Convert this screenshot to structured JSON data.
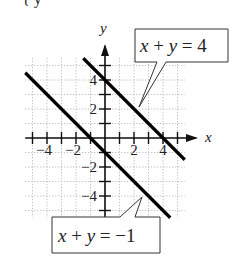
{
  "figure": {
    "top_fragment": "{   y",
    "axes": {
      "x_label": "x",
      "y_label": "y",
      "x_ticks": [
        -5,
        -4,
        -3,
        -2,
        -1,
        1,
        2,
        3,
        4,
        5
      ],
      "y_ticks": [
        -5,
        -4,
        -3,
        -2,
        -1,
        1,
        2,
        3,
        4,
        5
      ],
      "x_tick_labels": [
        {
          "value": -4,
          "text": "−4"
        },
        {
          "value": -2,
          "text": "−2"
        },
        {
          "value": 2,
          "text": "2"
        },
        {
          "value": 4,
          "text": "4"
        }
      ],
      "y_tick_labels": [
        {
          "value": 4,
          "text": "4"
        },
        {
          "value": 2,
          "text": "2"
        },
        {
          "value": -2,
          "text": "−2"
        },
        {
          "value": -4,
          "text": "−4"
        }
      ],
      "range": [
        -5.5,
        5.5
      ],
      "grid": "dotted"
    },
    "lines": [
      {
        "equation": "x + y = 4",
        "label_parts": [
          "x",
          " + ",
          "y",
          " = 4"
        ],
        "from": [
          -1.5,
          5.5
        ],
        "to": [
          5.5,
          -1.5
        ]
      },
      {
        "equation": "x + y = −1",
        "label_parts": [
          "x",
          " + ",
          "y",
          " = −1"
        ],
        "from": [
          -5.5,
          4.5
        ],
        "to": [
          4.5,
          -5.5
        ]
      }
    ]
  }
}
